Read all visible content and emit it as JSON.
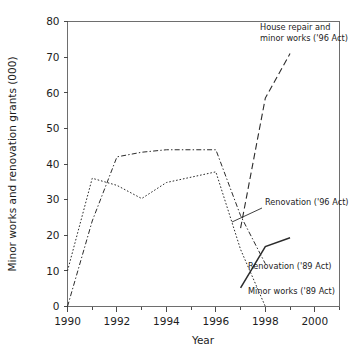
{
  "chart_data": {
    "type": "line",
    "title": "",
    "xlabel": "Year",
    "ylabel": "Minor works and renovation grants (000)",
    "xlim": [
      1990,
      2001
    ],
    "ylim": [
      0,
      80
    ],
    "grid": false,
    "legend_position": "inline-annotations",
    "x_ticks_major": [
      "1990",
      "1992",
      "1994",
      "1996",
      "1998",
      "2000"
    ],
    "x_ticks_major_values": [
      1990,
      1992,
      1994,
      1996,
      1998,
      2000
    ],
    "x_ticks_minor_values": [
      1991,
      1993,
      1995,
      1997,
      1999,
      2001
    ],
    "y_ticks": [
      "0",
      "10",
      "20",
      "30",
      "40",
      "50",
      "60",
      "70",
      "80"
    ],
    "y_ticks_values": [
      0,
      10,
      20,
      30,
      40,
      50,
      60,
      70,
      80
    ],
    "series": [
      {
        "name": "Minor works ('89 Act)",
        "style": "dotted",
        "x": [
          1990,
          1991,
          1992,
          1993,
          1994,
          1995,
          1996,
          1997,
          1998
        ],
        "values": [
          10,
          36,
          34,
          30.3,
          34.8,
          36.3,
          37.8,
          16,
          0
        ]
      },
      {
        "name": "Renovation ('89 Act)",
        "style": "dash-dot",
        "x": [
          1990,
          1991,
          1992,
          1993,
          1994,
          1995,
          1996,
          1997,
          1998
        ],
        "values": [
          0,
          24,
          42,
          43.3,
          44,
          44,
          44,
          25.5,
          12
        ]
      },
      {
        "name": "House repair and minor works ('96 Act)",
        "style": "long-dash",
        "x": [
          1997,
          1998,
          1999
        ],
        "values": [
          22,
          58.5,
          71
        ]
      },
      {
        "name": "Renovation ('96 Act)",
        "style": "solid",
        "x": [
          1997,
          1998,
          1999
        ],
        "values": [
          5.2,
          16.8,
          19.3
        ]
      }
    ],
    "annotations": [
      {
        "key": "house-repair",
        "lines": [
          "House repair and",
          "minor works ('96 Act)"
        ],
        "text": "House repair and minor works ('96 Act)"
      },
      {
        "key": "renovation-96",
        "lines": [
          "Renovation ('96 Act)"
        ],
        "text": "Renovation ('96 Act)"
      },
      {
        "key": "renovation-89",
        "lines": [
          "Renovation ('89 Act)"
        ],
        "text": "Renovation ('89 Act)"
      },
      {
        "key": "minor-works-89",
        "lines": [
          "Minor works ('89 Act)"
        ],
        "text": "Minor works ('89 Act)"
      }
    ],
    "colors": {
      "background": "#ffffff",
      "line": "#2b2b2b",
      "frame": "#6e6e6e",
      "text": "#1d1d1d"
    }
  }
}
